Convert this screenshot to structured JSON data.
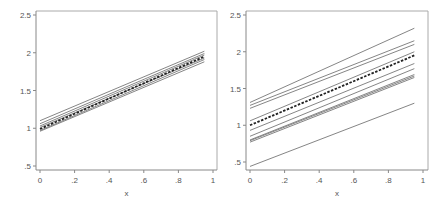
{
  "chart_data": [
    {
      "type": "line",
      "title": "",
      "xlabel": "x",
      "ylabel": "",
      "xlim": [
        0,
        1
      ],
      "ylim": [
        0.45,
        2.55
      ],
      "xticks": [
        0,
        0.2,
        0.4,
        0.6,
        0.8,
        1
      ],
      "xtick_labels": [
        "0",
        ".2",
        ".4",
        ".6",
        ".8",
        "1"
      ],
      "yticks": [
        0.5,
        1,
        1.5,
        2,
        2.5
      ],
      "ytick_labels": [
        ".5",
        "1",
        "1.5",
        "2",
        "2.5"
      ],
      "grid": false,
      "legend": null,
      "x": [
        0,
        0.95
      ],
      "series": [
        {
          "name": "line-1",
          "style": "solid",
          "values": [
            1.1,
            2.02
          ]
        },
        {
          "name": "line-2",
          "style": "solid",
          "values": [
            1.06,
            1.99
          ]
        },
        {
          "name": "line-3",
          "style": "solid",
          "values": [
            1.03,
            1.97
          ]
        },
        {
          "name": "line-4",
          "style": "solid",
          "values": [
            1.01,
            1.93
          ]
        },
        {
          "name": "line-5",
          "style": "solid",
          "values": [
            0.97,
            1.91
          ]
        },
        {
          "name": "line-6",
          "style": "solid",
          "values": [
            0.96,
            1.88
          ]
        },
        {
          "name": "mean",
          "style": "dashed",
          "values": [
            0.99,
            1.95
          ]
        }
      ]
    },
    {
      "type": "line",
      "title": "",
      "xlabel": "x",
      "ylabel": "",
      "xlim": [
        0,
        1
      ],
      "ylim": [
        0.35,
        2.55
      ],
      "xticks": [
        0,
        0.2,
        0.4,
        0.6,
        0.8,
        1
      ],
      "xtick_labels": [
        "0",
        ".2",
        ".4",
        ".6",
        ".8",
        "1"
      ],
      "yticks": [
        0.5,
        1,
        1.5,
        2,
        2.5
      ],
      "ytick_labels": [
        ".5",
        "1",
        "1.5",
        "2",
        "2.5"
      ],
      "grid": false,
      "legend": null,
      "x": [
        0,
        0.95
      ],
      "series": [
        {
          "name": "line-1",
          "style": "solid",
          "values": [
            1.31,
            2.32
          ]
        },
        {
          "name": "line-2",
          "style": "solid",
          "values": [
            1.27,
            2.15
          ]
        },
        {
          "name": "line-3",
          "style": "solid",
          "values": [
            1.23,
            2.1
          ]
        },
        {
          "name": "line-4",
          "style": "solid",
          "values": [
            1.06,
            2.0
          ]
        },
        {
          "name": "line-5",
          "style": "solid",
          "values": [
            0.93,
            1.84
          ]
        },
        {
          "name": "line-6",
          "style": "solid",
          "values": [
            0.85,
            1.77
          ]
        },
        {
          "name": "line-7",
          "style": "solid",
          "values": [
            0.8,
            1.69
          ]
        },
        {
          "name": "line-8",
          "style": "solid",
          "values": [
            0.79,
            1.67
          ]
        },
        {
          "name": "line-9",
          "style": "solid",
          "values": [
            0.77,
            1.65
          ]
        },
        {
          "name": "line-10",
          "style": "solid",
          "values": [
            0.44,
            1.3
          ]
        },
        {
          "name": "mean",
          "style": "dashed",
          "values": [
            1.0,
            1.95
          ]
        }
      ]
    }
  ],
  "panels": [
    {
      "xlabel": "x"
    },
    {
      "xlabel": "x"
    }
  ],
  "colors": {
    "line": "#777777",
    "mean_line": "#222222",
    "axis": "#888888",
    "frame": "#aaaaaa"
  }
}
